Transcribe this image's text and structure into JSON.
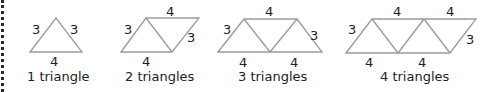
{
  "figures": [
    {
      "caption": "1 triangle",
      "labels": {
        "left": "3",
        "right": "3",
        "bottom": "4"
      }
    },
    {
      "caption": "2 triangles",
      "labels": {
        "top": "4",
        "left": "3",
        "right": "3",
        "bottom": "4"
      }
    },
    {
      "caption": "3 triangles",
      "labels": {
        "top": "4",
        "left": "3",
        "right": "3",
        "bottom1": "4",
        "bottom2": "4"
      }
    },
    {
      "caption": "4 triangles",
      "labels": {
        "top1": "4",
        "top2": "4",
        "left": "3",
        "right": "3",
        "bottom1": "4",
        "bottom2": "4"
      }
    }
  ],
  "colors": {
    "line": "#9a9a9a",
    "text": "#222222"
  }
}
